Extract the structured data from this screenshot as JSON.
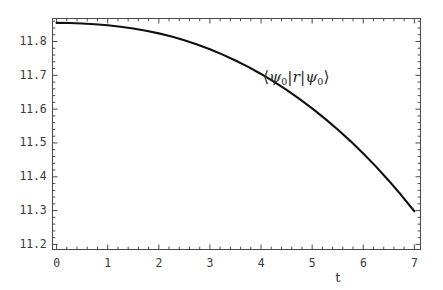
{
  "figure": {
    "background_color": "#ffffff",
    "frame_color": "#4a4a4a",
    "curve_color": "#101010",
    "text_color": "#3a3a3a"
  },
  "annotation": {
    "bra_open": "⟨",
    "psi": "ψ",
    "sub_zero": "0",
    "bar": "|",
    "operator": "r",
    "ket_close": "⟩",
    "full_text": "⟨ψ₀|r|ψ₀⟩"
  },
  "chart_data": {
    "type": "line",
    "title": "",
    "xlabel": "t",
    "ylabel": "",
    "xlim": [
      -0.08,
      7.12
    ],
    "ylim": [
      11.185,
      11.868
    ],
    "grid": false,
    "legend": null,
    "frame": true,
    "xticks": [
      0,
      1,
      2,
      3,
      4,
      5,
      6,
      7
    ],
    "xtick_labels": [
      "0",
      "1",
      "2",
      "3",
      "4",
      "5",
      "6",
      "7"
    ],
    "x_minor_ticks_per_interval": 4,
    "yticks": [
      11.2,
      11.3,
      11.4,
      11.5,
      11.6,
      11.7,
      11.8
    ],
    "ytick_labels": [
      "11.2",
      "11.3",
      "11.4",
      "11.5",
      "11.6",
      "11.7",
      "11.8"
    ],
    "y_minor_ticks_per_interval": 4,
    "annotations": [
      {
        "text": "⟨ψ₀|r|ψ₀⟩",
        "x": 4.9,
        "y": 11.69
      }
    ],
    "series": [
      {
        "name": "<psi_0|r|psi_0>",
        "x": [
          0.0,
          0.25,
          0.5,
          0.75,
          1.0,
          1.25,
          1.5,
          1.75,
          2.0,
          2.25,
          2.5,
          2.75,
          3.0,
          3.25,
          3.5,
          3.75,
          4.0,
          4.25,
          4.5,
          4.75,
          5.0,
          5.25,
          5.5,
          5.75,
          6.0,
          6.25,
          6.5,
          6.75,
          7.0
        ],
        "values": [
          11.855,
          11.8545,
          11.8532,
          11.851,
          11.848,
          11.8438,
          11.8385,
          11.832,
          11.824,
          11.8145,
          11.8035,
          11.791,
          11.777,
          11.7612,
          11.7438,
          11.7248,
          11.704,
          11.6812,
          11.6568,
          11.6305,
          11.6022,
          11.572,
          11.5398,
          11.5055,
          11.469,
          11.43,
          11.3885,
          11.3445,
          11.298
        ]
      }
    ]
  }
}
